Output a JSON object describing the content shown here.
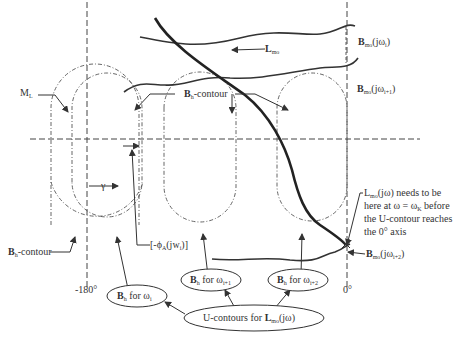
{
  "diagram": {
    "axes": {
      "horizontal_axis": "dashed horizontal reference line",
      "left_axis_label": "-180°",
      "right_axis_label": "0°"
    },
    "curves": {
      "loop_transmission": "L_mo",
      "bound_top": "B_mo(jω_i)",
      "bound_mid": "B_mo(jω_{i+1})",
      "bound_bottom": "B_mo(jω_{i+2})"
    },
    "labels": {
      "ML": "M",
      "ML_sub": "L",
      "bh_contour": "B",
      "bh_contour_sub": "h",
      "bh_contour_suffix": "-contour",
      "bh_prime_contour": "B",
      "bh_prime_sub": "h",
      "bh_prime_suffix": "-contour",
      "lmo_main": "L",
      "lmo_sub": "mo",
      "gamma": "γ",
      "phase_label": "[-ϕ",
      "phase_sub": "A",
      "phase_suffix": "(jw",
      "phase_sub2": "i",
      "phase_end": ")]",
      "bmo_top": "B",
      "bmo_top_sub": "mo",
      "bmo_top_suffix": "(jω",
      "bmo_top_idx": "i",
      "bmo_top_end": ")",
      "bmo_mid": "B",
      "bmo_mid_sub": "mo",
      "bmo_mid_suffix": "(jω",
      "bmo_mid_idx": "i+1",
      "bmo_mid_end": ")",
      "bmo_bot": "B",
      "bmo_bot_sub": "mo",
      "bmo_bot_suffix": "(jω",
      "bmo_bot_idx": "i+2",
      "bmo_bot_end": ")",
      "note_line1_a": "L",
      "note_line1_sub": "mo",
      "note_line1_b": "(jω) needs to be",
      "note_line2_a": "here at ω = ω",
      "note_line2_sub": "K",
      "note_line2_b": " before",
      "note_line3": "the U-contour reaches",
      "note_line4": "the 0° axis"
    },
    "ovals": [
      {
        "main": "B",
        "sub": "h",
        "text": " for ω",
        "idx": "i"
      },
      {
        "main": "B",
        "sub": "h",
        "text": " for ω",
        "idx": "i+1"
      },
      {
        "main": "B",
        "sub": "h",
        "text": " for ω",
        "idx": "i+2"
      }
    ],
    "bottom_oval": {
      "prefix": "U-contours for ",
      "main": "L",
      "sub": "mo",
      "suffix": "(jω)"
    }
  }
}
